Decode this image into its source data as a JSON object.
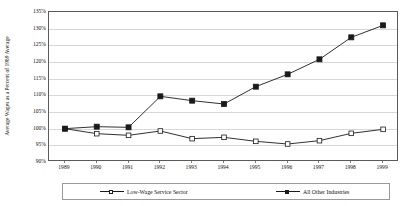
{
  "chart_data": {
    "type": "line",
    "title": "",
    "xlabel": "",
    "ylabel": "Average Wages as a Percent of 1989 Average",
    "categories": [
      "1989",
      "1990",
      "1991",
      "1992",
      "1993",
      "1994",
      "1995",
      "1996",
      "1997",
      "1998",
      "1999"
    ],
    "ylim": [
      90,
      135
    ],
    "ytick_labels": [
      "90%",
      "95%",
      "100%",
      "105%",
      "110%",
      "115%",
      "120%",
      "125%",
      "130%",
      "135%"
    ],
    "ytick_values": [
      90,
      95,
      100,
      105,
      110,
      115,
      120,
      125,
      130,
      135
    ],
    "grid": true,
    "legend_position": "bottom",
    "series": [
      {
        "name": "Low-Wage Service Sector",
        "marker": "open-square",
        "color": "#1a1a1a",
        "values": [
          100.0,
          98.5,
          98.0,
          99.3,
          97.0,
          97.4,
          96.2,
          95.4,
          96.4,
          98.6,
          99.8
        ]
      },
      {
        "name": "All Other Industries",
        "marker": "filled-square",
        "color": "#1a1a1a",
        "values": [
          100.0,
          100.6,
          100.4,
          109.7,
          108.4,
          107.4,
          112.6,
          116.3,
          120.8,
          127.4,
          131.0
        ]
      }
    ]
  },
  "legend": {
    "entries": [
      {
        "label": "Low-Wage Service Sector",
        "marker": "open-square"
      },
      {
        "label": "All Other Industries",
        "marker": "filled-square"
      }
    ]
  }
}
